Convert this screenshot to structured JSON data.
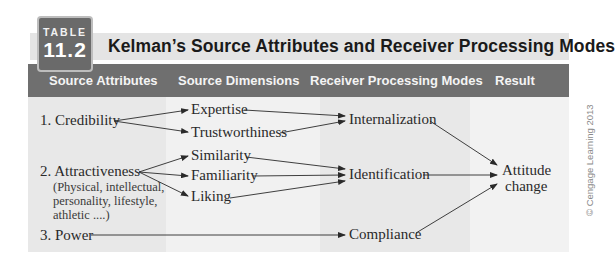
{
  "badge": {
    "label": "TABLE",
    "number": "11.2"
  },
  "title": "Kelman’s Source Attributes and Receiver Processing Modes",
  "header": {
    "columns": [
      "Source Attributes",
      "Source Dimensions",
      "Receiver Processing Modes",
      "Result"
    ]
  },
  "colors": {
    "badge_bg": "#6a6a6a",
    "header_bg": "#6f6f6f",
    "title_bg": "#e4e4e4",
    "col_dark": "#e8e8e8",
    "col_light": "#f2f2f2",
    "text": "#2a2a2a"
  },
  "source_attributes": [
    {
      "label": "1. Credibility"
    },
    {
      "label": "2. Attractiveness",
      "detail": [
        "(Physical, intellectual,",
        "personality, lifestyle,",
        "athletic ....)"
      ]
    },
    {
      "label": "3. Power"
    }
  ],
  "source_dimensions": [
    "Expertise",
    "Trustworthiness",
    "Similarity",
    "Familiarity",
    "Liking"
  ],
  "processing_modes": [
    "Internalization",
    "Identification",
    "Compliance"
  ],
  "result": {
    "line1": "Attitude",
    "line2": "change"
  },
  "credit": "© Cengage Learning 2013"
}
